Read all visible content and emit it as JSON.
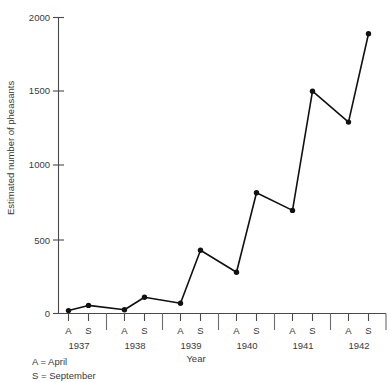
{
  "chart_data": {
    "type": "line",
    "title": "",
    "xlabel": "Year",
    "ylabel": "Estimated number of pheasants",
    "ylim": [
      0,
      2000
    ],
    "yticks": [
      0,
      500,
      1000,
      1500,
      2000
    ],
    "ytick_labels": [
      "0",
      "500",
      "1000",
      "1500",
      "2000"
    ],
    "grid": false,
    "legend_position": "below-left",
    "x": [
      "1937 A",
      "1937 S",
      "1938 A",
      "1938 S",
      "1939 A",
      "1939 S",
      "1940 A",
      "1940 S",
      "1941 A",
      "1941 S",
      "1942 A",
      "1942 S"
    ],
    "xtick_labels": [
      "A",
      "S",
      "A",
      "S",
      "A",
      "S",
      "A",
      "S",
      "A",
      "S",
      "A",
      "S"
    ],
    "year_groups": [
      "1937",
      "1938",
      "1939",
      "1940",
      "1941",
      "1942"
    ],
    "values": [
      20,
      55,
      25,
      110,
      70,
      430,
      280,
      820,
      700,
      1510,
      1300,
      1900
    ],
    "series": [
      {
        "name": "Estimated number of pheasants",
        "values": [
          20,
          55,
          25,
          110,
          70,
          430,
          280,
          820,
          700,
          1510,
          1300,
          1900
        ]
      }
    ],
    "annotations": [
      "A = April",
      "S = September"
    ],
    "line_color": "#111111",
    "marker_color": "#111111",
    "axis_color": "#4a4a4a",
    "text_color": "#3a3a3a",
    "background_color": "#ffffff"
  },
  "axes": {
    "y_axis_title": "Estimated number of pheasants",
    "x_axis_title": "Year",
    "y_tick_0": "0",
    "y_tick_500": "500",
    "y_tick_1000": "1000",
    "y_tick_1500": "1500",
    "y_tick_2000": "2000"
  },
  "legend": {
    "april": "A = April",
    "september": "S = September"
  },
  "xaxis": {
    "marks": [
      "A",
      "S",
      "A",
      "S",
      "A",
      "S",
      "A",
      "S",
      "A",
      "S",
      "A",
      "S"
    ],
    "years": [
      "1937",
      "1938",
      "1939",
      "1940",
      "1941",
      "1942"
    ]
  }
}
